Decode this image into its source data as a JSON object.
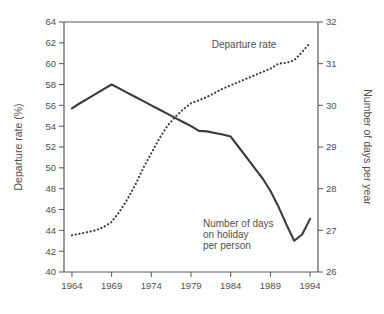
{
  "chart_data": {
    "type": "line",
    "title": "",
    "xlabel": "",
    "ylabel": "Departure rate (%)",
    "y2label": "Number of days per year",
    "x": [
      1964,
      1965,
      1966,
      1967,
      1968,
      1969,
      1970,
      1971,
      1972,
      1973,
      1974,
      1975,
      1976,
      1977,
      1978,
      1979,
      1980,
      1981,
      1982,
      1983,
      1984,
      1985,
      1986,
      1987,
      1988,
      1989,
      1990,
      1991,
      1992,
      1993,
      1994
    ],
    "xlim": [
      1963,
      1995
    ],
    "xticks": [
      1964,
      1969,
      1974,
      1979,
      1984,
      1989,
      1994
    ],
    "xticklabels": [
      "1964",
      "1969",
      "1974",
      "1979",
      "1984",
      "1989",
      "1994"
    ],
    "ylim": [
      40,
      64
    ],
    "yticks": [
      40,
      42,
      44,
      46,
      48,
      50,
      52,
      54,
      56,
      58,
      60,
      62,
      64
    ],
    "yticklabels": [
      "40",
      "42",
      "44",
      "46",
      "48",
      "50",
      "52",
      "54",
      "56",
      "58",
      "60",
      "62",
      "64"
    ],
    "y2lim": [
      26,
      32
    ],
    "y2ticks": [
      26,
      27,
      28,
      29,
      30,
      31,
      32
    ],
    "y2ticklabels": [
      "26",
      "27",
      "28",
      "29",
      "30",
      "31",
      "32"
    ],
    "grid": false,
    "legend_position": "inline-annotations",
    "series": [
      {
        "name": "Departure rate",
        "style": "dotted",
        "axis": "right",
        "unit": "days per year",
        "label_text": "Departure rate",
        "label_x": 1982.0,
        "label_y": 61.6,
        "values_right_axis": [
          26.88,
          26.92,
          26.96,
          27.0,
          27.08,
          27.2,
          27.45,
          27.75,
          28.1,
          28.5,
          28.85,
          29.2,
          29.5,
          29.72,
          29.9,
          30.05,
          30.12,
          30.2,
          30.3,
          30.4,
          30.48,
          30.56,
          30.64,
          30.72,
          30.8,
          30.88,
          31.0,
          31.02,
          31.08,
          31.28,
          31.5
        ],
        "values_left_axis_equivalent": [
          43.5,
          43.68,
          43.84,
          44.0,
          44.32,
          44.8,
          45.8,
          47.0,
          48.4,
          50.0,
          51.4,
          52.8,
          54.0,
          54.88,
          55.6,
          56.2,
          56.48,
          56.8,
          57.2,
          57.6,
          57.92,
          58.24,
          58.56,
          58.88,
          59.2,
          59.52,
          60.0,
          60.08,
          60.32,
          61.12,
          62.0
        ]
      },
      {
        "name": "Number of days on holiday per person",
        "style": "solid",
        "axis": "left",
        "unit": "%",
        "label_text": "Number of days\non holiday\nper person",
        "label_lines": [
          "Number of days",
          "on holiday",
          "per person"
        ],
        "label_x": 1982.0,
        "label_y": 45.6,
        "values": [
          55.7,
          56.2,
          56.65,
          57.1,
          57.55,
          58.0,
          57.6,
          57.2,
          56.8,
          56.4,
          56.0,
          55.6,
          55.2,
          54.8,
          54.4,
          54.0,
          53.55,
          53.5,
          53.35,
          53.2,
          53.0,
          52.0,
          51.0,
          50.0,
          49.0,
          47.8,
          46.3,
          44.6,
          43.0,
          43.6,
          45.1
        ]
      }
    ]
  }
}
